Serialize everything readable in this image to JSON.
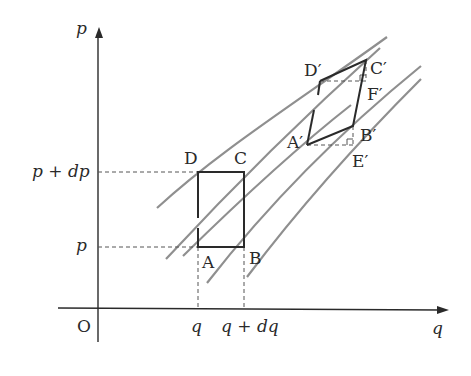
{
  "figure": {
    "axes": {
      "y_label": "p",
      "x_label": "q",
      "origin_label": "O"
    },
    "ticks": {
      "y": [
        "p + dp",
        "p"
      ],
      "x": [
        "q",
        "q + dq"
      ]
    },
    "rectangle": {
      "vertices": {
        "A": "A",
        "B": "B",
        "C": "C",
        "D": "D"
      }
    },
    "parallelogram": {
      "vertices": {
        "A": "A′",
        "B": "B′",
        "C": "C′",
        "D": "D′",
        "E": "E′",
        "F": "F′"
      }
    },
    "colors": {
      "axis": "#2a2a2a",
      "curve": "#8a8a8a",
      "shape": "#2a2a2a",
      "guide": "#555555"
    }
  }
}
